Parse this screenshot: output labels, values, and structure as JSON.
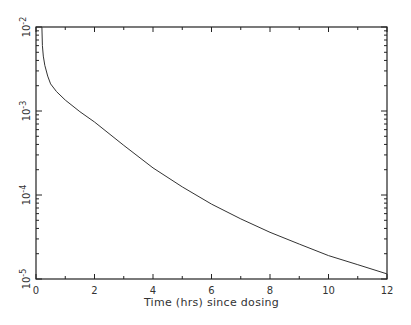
{
  "chart_data": {
    "type": "line",
    "title": "",
    "xlabel": "Time (hrs) since dosing",
    "ylabel": "",
    "xlim": [
      0,
      12
    ],
    "ylim": [
      1e-05,
      0.01
    ],
    "yscale": "log",
    "grid": false,
    "legend": null,
    "x_ticks": [
      0,
      2,
      4,
      6,
      8,
      10,
      12
    ],
    "x_tick_labels": [
      "0",
      "2",
      "4",
      "6",
      "8",
      "10",
      "12"
    ],
    "y_ticks": [
      0.01,
      0.001,
      0.0001,
      1e-05
    ],
    "y_tick_labels": [
      {
        "base": "10",
        "exp": "-2"
      },
      {
        "base": "10",
        "exp": "-3"
      },
      {
        "base": "10",
        "exp": "-4"
      },
      {
        "base": "10",
        "exp": "-5"
      }
    ],
    "series": [
      {
        "name": "concentration",
        "color": "#333333",
        "x": [
          0.2,
          0.22,
          0.25,
          0.3,
          0.4,
          0.5,
          0.7,
          1.0,
          1.5,
          2,
          3,
          4,
          5,
          6,
          7,
          8,
          9,
          10,
          11,
          12
        ],
        "y": [
          0.01,
          0.006,
          0.0045,
          0.0035,
          0.0026,
          0.0021,
          0.0017,
          0.00135,
          0.00098,
          0.00074,
          0.00039,
          0.00021,
          0.000125,
          7.8e-05,
          5.2e-05,
          3.6e-05,
          2.6e-05,
          1.9e-05,
          1.48e-05,
          1.15e-05
        ]
      }
    ]
  },
  "axes": {
    "x_title": "Time (hrs) since dosing"
  }
}
